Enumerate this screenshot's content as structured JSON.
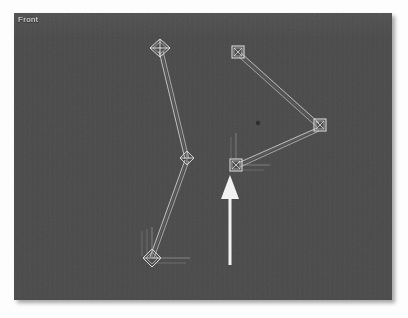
{
  "viewport": {
    "label": "Front",
    "background_color": "#4a4a4a",
    "page_background_color": "#fdfdfd",
    "bounds": {
      "left": 14,
      "top": 13,
      "width": 378,
      "height": 287
    }
  },
  "scene": {
    "type": "3d-bone-rig-front-view",
    "wire_color": "#d8d8d8",
    "bone_color": "#cfcfcf",
    "manipulator_color": "#b9b9b9",
    "chains": [
      {
        "name": "left-leg-chain",
        "joint_style": "diamond",
        "joints": [
          {
            "name": "left-hip-joint",
            "x": 146,
            "y": 35,
            "size": 11,
            "style": "diamond-cross"
          },
          {
            "name": "left-knee-joint",
            "x": 173,
            "y": 145,
            "size": 7,
            "style": "diamond-cross"
          },
          {
            "name": "left-foot-joint",
            "x": 138,
            "y": 245,
            "size": 9,
            "style": "diamond-cross",
            "manipulator": true
          }
        ],
        "bones": [
          {
            "name": "left-thigh-bone",
            "from": "left-hip-joint",
            "to": "left-knee-joint"
          },
          {
            "name": "left-shin-bone",
            "from": "left-knee-joint",
            "to": "left-foot-joint"
          }
        ]
      },
      {
        "name": "right-arm-chain",
        "joint_style": "square",
        "joints": [
          {
            "name": "right-shoulder-joint",
            "x": 224,
            "y": 39,
            "size": 9,
            "style": "square-cross"
          },
          {
            "name": "right-elbow-joint",
            "x": 306,
            "y": 112,
            "size": 9,
            "style": "square-cross"
          },
          {
            "name": "right-wrist-joint",
            "x": 222,
            "y": 152,
            "size": 9,
            "style": "square-cross",
            "manipulator": true
          }
        ],
        "bones": [
          {
            "name": "right-upper-arm-bone",
            "from": "right-shoulder-joint",
            "to": "right-elbow-joint"
          },
          {
            "name": "right-forearm-bone",
            "from": "right-elbow-joint",
            "to": "right-wrist-joint"
          }
        ]
      }
    ],
    "pivot_dot": {
      "name": "scene-pivot-dot",
      "x": 244,
      "y": 110,
      "radius": 2,
      "color": "#2c2c2c"
    }
  },
  "annotation": {
    "arrow": {
      "name": "callout-arrow-up",
      "direction": "up",
      "color": "#f2f2f2",
      "tip_x": 216,
      "tip_y": 162,
      "tail_y": 252,
      "head_width": 18,
      "head_height": 22,
      "shaft_width": 3,
      "points_at": "right-wrist-joint"
    }
  }
}
